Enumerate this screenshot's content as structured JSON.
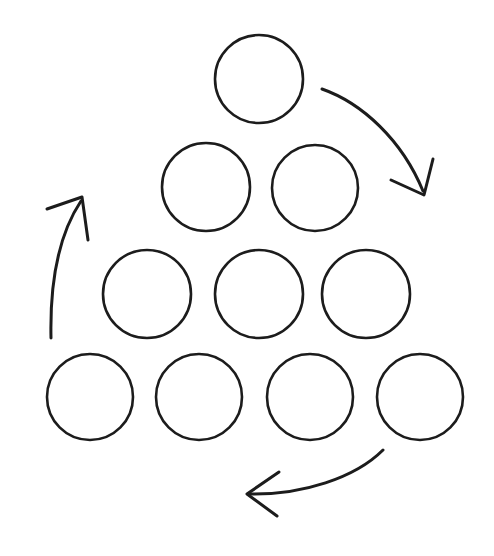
{
  "figure": {
    "title": "Triangular arrangement of ten circles with three curved cycle arrows",
    "style": "hand-drawn line sketch",
    "background_color": "#ffffff",
    "stroke_color": "#1c1c1c",
    "canvas": {
      "width": 494,
      "height": 556
    }
  },
  "circles": {
    "count": 10,
    "layout": "triangular rows of 1, 2, 3, 4 from top to bottom",
    "radius": 44,
    "rows": [
      {
        "row_index": 1,
        "count": 1,
        "label": "row-1",
        "items": [
          {
            "id": "circle-1",
            "cx": 259,
            "cy": 79,
            "r": 44
          }
        ]
      },
      {
        "row_index": 2,
        "count": 2,
        "label": "row-2",
        "items": [
          {
            "id": "circle-2",
            "cx": 206,
            "cy": 187,
            "r": 44
          },
          {
            "id": "circle-3",
            "cx": 315,
            "cy": 188,
            "r": 43
          }
        ]
      },
      {
        "row_index": 3,
        "count": 3,
        "label": "row-3",
        "items": [
          {
            "id": "circle-4",
            "cx": 147,
            "cy": 294,
            "r": 44
          },
          {
            "id": "circle-5",
            "cx": 259,
            "cy": 294,
            "r": 44
          },
          {
            "id": "circle-6",
            "cx": 366,
            "cy": 294,
            "r": 44
          }
        ]
      },
      {
        "row_index": 4,
        "count": 4,
        "label": "row-4",
        "items": [
          {
            "id": "circle-7",
            "cx": 90,
            "cy": 397,
            "r": 43
          },
          {
            "id": "circle-8",
            "cx": 199,
            "cy": 397,
            "r": 43
          },
          {
            "id": "circle-9",
            "cx": 310,
            "cy": 397,
            "r": 43
          },
          {
            "id": "circle-10",
            "cx": 420,
            "cy": 397,
            "r": 43
          }
        ]
      }
    ]
  },
  "arrows": {
    "count": 3,
    "direction": "clockwise cycle around the triangle",
    "items": [
      {
        "id": "arrow-right-descending",
        "label": "top-right arrow pointing down-right",
        "shaft_path": "M 322 89 C 362 103 402 140 423 191",
        "tip": {
          "x": 424,
          "y": 195
        },
        "barbs": "M 433 159 L 424 195 L 391 180"
      },
      {
        "id": "arrow-bottom-leftward",
        "label": "bottom arrow pointing left",
        "shaft_path": "M 383 450 C 355 478 302 495 250 494",
        "tip": {
          "x": 247,
          "y": 494
        },
        "barbs": "M 279 472 L 247 494 L 277 516"
      },
      {
        "id": "arrow-left-ascending",
        "label": "left arrow pointing up",
        "shaft_path": "M 51 338 C 50 292 55 240 81 201",
        "tip": {
          "x": 82,
          "y": 197
        },
        "barbs": "M 47 209 L 82 197 L 88 240"
      }
    ]
  }
}
